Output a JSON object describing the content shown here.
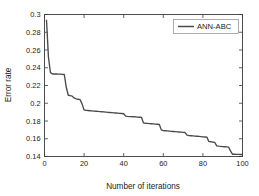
{
  "chart_data": {
    "type": "line",
    "title": "",
    "xlabel": "Number of iterations",
    "ylabel": "Error rate",
    "xlim": [
      0,
      100
    ],
    "ylim": [
      0.14,
      0.3
    ],
    "xticks": [
      0,
      20,
      40,
      60,
      80,
      100
    ],
    "xtick_labels": [
      "0",
      "20",
      "40",
      "60",
      "80",
      "100"
    ],
    "yticks": [
      0.14,
      0.16,
      0.18,
      0.2,
      0.22,
      0.24,
      0.26,
      0.28,
      0.3
    ],
    "ytick_labels": [
      "0.14",
      "0.16",
      "0.18",
      "0.2",
      "0.22",
      "0.24",
      "0.26",
      "0.28",
      "0.3"
    ],
    "grid": false,
    "legend_position": "top-right",
    "legend": [
      "ANN-ABC"
    ],
    "series": [
      {
        "name": "ANN-ABC",
        "color": "#4a4a4a",
        "x": [
          1,
          2,
          3,
          4,
          5,
          6,
          7,
          8,
          9,
          10,
          11,
          12,
          13,
          14,
          15,
          16,
          17,
          18,
          19,
          20,
          21,
          22,
          23,
          24,
          25,
          26,
          27,
          28,
          29,
          30,
          31,
          32,
          33,
          34,
          35,
          36,
          37,
          38,
          39,
          40,
          41,
          42,
          43,
          44,
          45,
          46,
          47,
          48,
          49,
          50,
          51,
          52,
          53,
          54,
          55,
          56,
          57,
          58,
          59,
          60,
          61,
          62,
          63,
          64,
          65,
          66,
          67,
          68,
          69,
          70,
          71,
          72,
          73,
          74,
          75,
          76,
          77,
          78,
          79,
          80,
          81,
          82,
          83,
          84,
          85,
          86,
          87,
          88,
          89,
          90,
          91,
          92,
          93,
          94,
          95,
          96,
          97,
          98,
          99,
          100
        ],
        "y": [
          0.294,
          0.252,
          0.2345,
          0.233,
          0.233,
          0.233,
          0.2328,
          0.2328,
          0.2326,
          0.2324,
          0.218,
          0.209,
          0.2085,
          0.208,
          0.206,
          0.205,
          0.2045,
          0.204,
          0.199,
          0.1925,
          0.192,
          0.1918,
          0.1916,
          0.1914,
          0.1912,
          0.191,
          0.1908,
          0.1906,
          0.1904,
          0.1902,
          0.19,
          0.1898,
          0.1896,
          0.1894,
          0.1892,
          0.189,
          0.1888,
          0.1886,
          0.1884,
          0.1882,
          0.1855,
          0.1852,
          0.185,
          0.185,
          0.1848,
          0.1846,
          0.1844,
          0.1842,
          0.184,
          0.1778,
          0.1775,
          0.1773,
          0.1771,
          0.1769,
          0.1767,
          0.1765,
          0.1763,
          0.1761,
          0.17,
          0.1692,
          0.169,
          0.1688,
          0.1686,
          0.1684,
          0.1682,
          0.168,
          0.1678,
          0.1676,
          0.1674,
          0.1672,
          0.167,
          0.164,
          0.1636,
          0.1634,
          0.1632,
          0.163,
          0.1628,
          0.1626,
          0.1624,
          0.1622,
          0.162,
          0.1618,
          0.157,
          0.1566,
          0.1562,
          0.1558,
          0.152,
          0.1516,
          0.1514,
          0.1512,
          0.151,
          0.1508,
          0.1506,
          0.146,
          0.1425,
          0.1425,
          0.1424,
          0.1424,
          0.1423,
          0.1423
        ]
      }
    ]
  },
  "figure": {
    "background_color": "#ffffff",
    "axis_color": "#3b3b3b",
    "text_color": "#1a1a1a"
  }
}
